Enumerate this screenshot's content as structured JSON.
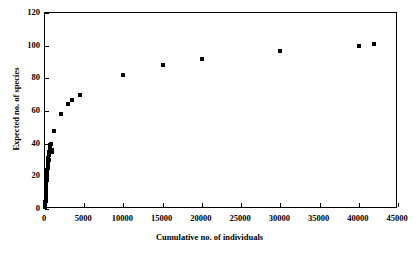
{
  "chart_data": {
    "type": "scatter",
    "title": "",
    "xlabel": "Cumulative no. of individuals",
    "ylabel": "Expected no. of species",
    "xlim": [
      0,
      45000
    ],
    "ylim": [
      0,
      120
    ],
    "xticks": [
      0,
      5000,
      10000,
      15000,
      20000,
      25000,
      30000,
      35000,
      40000,
      45000
    ],
    "yticks": [
      0,
      20,
      40,
      60,
      80,
      100,
      120
    ],
    "xtick_labels": [
      "0",
      "5000",
      "10000",
      "15000",
      "20000",
      "25000",
      "30000",
      "35000",
      "40000",
      "45000"
    ],
    "ytick_labels": [
      "0",
      "20",
      "40",
      "60",
      "80",
      "100",
      "120"
    ],
    "grid": false,
    "legend": false,
    "marker": "square",
    "marker_color": "#000000",
    "series": [
      {
        "name": "Expected species accumulation",
        "points": [
          [
            40,
            1
          ],
          [
            45,
            2
          ],
          [
            50,
            3
          ],
          [
            60,
            4
          ],
          [
            70,
            5
          ],
          [
            80,
            6
          ],
          [
            90,
            7
          ],
          [
            100,
            8
          ],
          [
            110,
            9
          ],
          [
            120,
            10
          ],
          [
            130,
            11
          ],
          [
            140,
            12
          ],
          [
            150,
            13
          ],
          [
            160,
            14
          ],
          [
            170,
            15
          ],
          [
            180,
            16
          ],
          [
            190,
            17
          ],
          [
            200,
            18
          ],
          [
            210,
            19
          ],
          [
            220,
            20
          ],
          [
            230,
            21
          ],
          [
            250,
            22
          ],
          [
            280,
            23
          ],
          [
            300,
            24
          ],
          [
            320,
            25
          ],
          [
            350,
            26
          ],
          [
            380,
            27
          ],
          [
            400,
            28
          ],
          [
            420,
            29
          ],
          [
            450,
            30
          ],
          [
            300,
            22
          ],
          [
            350,
            27
          ],
          [
            400,
            31
          ],
          [
            500,
            33
          ],
          [
            520,
            34
          ],
          [
            560,
            35
          ],
          [
            600,
            36
          ],
          [
            620,
            37
          ],
          [
            680,
            38
          ],
          [
            700,
            39
          ],
          [
            750,
            40
          ],
          [
            900,
            35
          ],
          [
            950,
            36
          ],
          [
            1200,
            48
          ],
          [
            2100,
            58
          ],
          [
            2900,
            64
          ],
          [
            3500,
            67
          ],
          [
            4400,
            70
          ],
          [
            10000,
            82
          ],
          [
            15000,
            88
          ],
          [
            20000,
            92
          ],
          [
            30000,
            97
          ],
          [
            40000,
            100
          ],
          [
            42000,
            101
          ]
        ]
      }
    ]
  }
}
